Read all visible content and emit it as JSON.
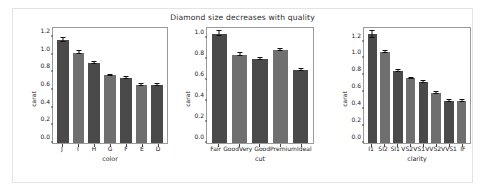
{
  "chart_data": [
    {
      "type": "bar",
      "title": "Diamond size decreases with quality",
      "xlabel": "color",
      "ylabel": "carat",
      "ylim": [
        0,
        1.3
      ],
      "yticks": [
        0.0,
        0.2,
        0.4,
        0.6,
        0.8,
        1.0,
        1.2
      ],
      "ytick_labels": [
        "0.0",
        "0.2",
        "0.4",
        "0.6",
        "0.8",
        "1.0",
        "1.2"
      ],
      "grid": false,
      "legend": "none",
      "categories": [
        "J",
        "I",
        "H",
        "G",
        "F",
        "E",
        "D"
      ],
      "values": [
        1.16,
        1.02,
        0.905,
        0.765,
        0.735,
        0.655,
        0.655
      ],
      "errors": [
        0.022,
        0.015,
        0.012,
        0.009,
        0.009,
        0.008,
        0.009
      ]
    },
    {
      "type": "bar",
      "title": "",
      "xlabel": "cut",
      "ylabel": "carat",
      "ylim": [
        0,
        1.1
      ],
      "yticks": [
        0.0,
        0.2,
        0.4,
        0.6,
        0.8,
        1.0
      ],
      "ytick_labels": [
        "0.0",
        "0.2",
        "0.4",
        "0.6",
        "0.8",
        "1.0"
      ],
      "grid": false,
      "legend": "none",
      "categories": [
        "Fair",
        "Good",
        "Very Good",
        "Premium",
        "Ideal"
      ],
      "values": [
        1.045,
        0.845,
        0.805,
        0.89,
        0.7
      ],
      "errors": [
        0.022,
        0.012,
        0.009,
        0.009,
        0.008
      ]
    },
    {
      "type": "bar",
      "title": "",
      "xlabel": "clarity",
      "ylabel": "carat",
      "ylim": [
        0,
        1.36
      ],
      "yticks": [
        0.0,
        0.2,
        0.4,
        0.6,
        0.8,
        1.0,
        1.2
      ],
      "ytick_labels": [
        "0.0",
        "0.2",
        "0.4",
        "0.6",
        "0.8",
        "1.0",
        "1.2"
      ],
      "grid": false,
      "legend": "none",
      "categories": [
        "I1",
        "SI2",
        "SI1",
        "VS2",
        "VS1",
        "VVS2",
        "VVS1",
        "IF"
      ],
      "values": [
        1.285,
        1.073,
        0.847,
        0.763,
        0.72,
        0.593,
        0.497,
        0.5
      ],
      "errors": [
        0.038,
        0.012,
        0.011,
        0.008,
        0.009,
        0.009,
        0.009,
        0.012
      ]
    }
  ],
  "figure": {
    "title": "Diamond size decreases with quality",
    "bar_color_dark": "#4a4a4a",
    "bar_color_light": "#6f6f6f",
    "error_color": "#101010",
    "axis_color": "#9a9a9a",
    "background": "#ffffff"
  }
}
